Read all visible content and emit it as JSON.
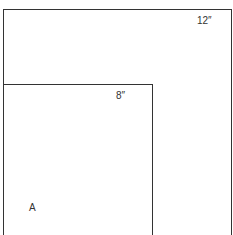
{
  "diagram": {
    "outer_square": {
      "label": "12″"
    },
    "inner_square": {
      "label": "8″"
    },
    "region_label": "A"
  },
  "colors": {
    "line": "#333333",
    "background": "#ffffff",
    "text": "#333333"
  }
}
